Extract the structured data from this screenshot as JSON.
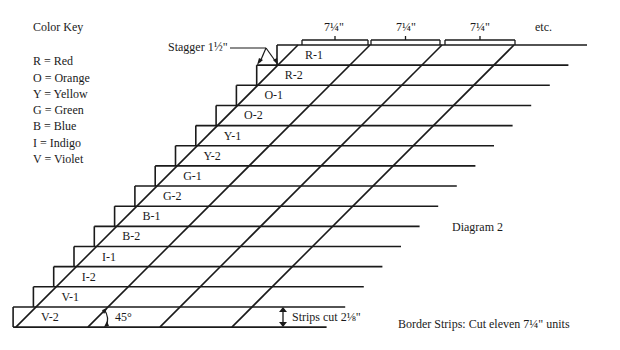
{
  "color_key": {
    "title": "Color Key",
    "items": [
      {
        "code": "R",
        "label": "R = Red"
      },
      {
        "code": "O",
        "label": "O = Orange"
      },
      {
        "code": "Y",
        "label": "Y = Yellow"
      },
      {
        "code": "G",
        "label": "G = Green"
      },
      {
        "code": "B",
        "label": "B = Blue"
      },
      {
        "code": "I",
        "label": "I = Indigo"
      },
      {
        "code": "V",
        "label": "V = Violet"
      }
    ]
  },
  "strips": [
    "R-1",
    "R-2",
    "O-1",
    "O-2",
    "Y-1",
    "Y-2",
    "G-1",
    "G-2",
    "B-1",
    "B-2",
    "I-1",
    "I-2",
    "V-1",
    "V-2"
  ],
  "annotations": {
    "stagger": "Stagger 1½\"",
    "unit_width_labels": [
      "7¼\"",
      "7¼\"",
      "7¼\""
    ],
    "etc": "etc.",
    "angle": "45°",
    "strip_width": "Strips cut 2⅛\"",
    "diagram_title": "Diagram 2",
    "border_note": "Border Strips: Cut eleven 7¼\" units"
  },
  "geometry": {
    "row_count": 14,
    "top_y": 45,
    "row_height": 20.15,
    "top_left_x": 277,
    "step_x": 20.3,
    "top_right_x": 587,
    "right_step": 18.6,
    "diagonal_spacing": 72,
    "line_color": "#1a1a1a"
  }
}
